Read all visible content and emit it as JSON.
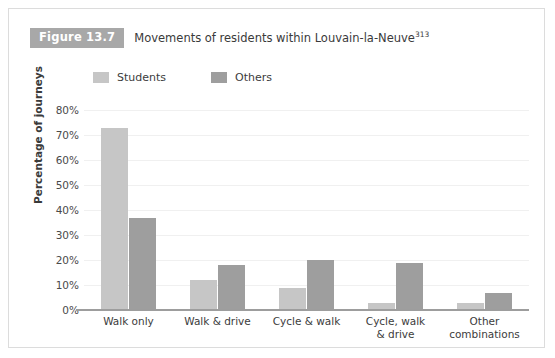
{
  "figure": {
    "tag": "Figure 13.7",
    "caption": "Movements of residents within Louvain-la-Neuve",
    "caption_superscript": "313"
  },
  "colors": {
    "students": "#c6c6c6",
    "others": "#9e9e9e",
    "tag_background": "#a8a8a8",
    "axis": "#9d9d9d",
    "gridline": "#f0f0f0",
    "card_border": "#dcdcdc",
    "text": "#3c3c3c"
  },
  "chart_data": {
    "type": "bar",
    "title": "Movements of residents within Louvain-la-Neuve",
    "xlabel": "",
    "ylabel": "Percentage of journeys",
    "ylim": [
      0,
      80
    ],
    "ytick_labels": [
      "0%",
      "10%",
      "20%",
      "30%",
      "40%",
      "50%",
      "60%",
      "70%",
      "80%"
    ],
    "ytick_values": [
      0,
      10,
      20,
      30,
      40,
      50,
      60,
      70,
      80
    ],
    "grid": true,
    "legend_position": "top-left",
    "categories": [
      "Walk only",
      "Walk & drive",
      "Cycle & walk",
      "Cycle, walk & drive",
      "Other combinations"
    ],
    "category_lines": [
      [
        "Walk only"
      ],
      [
        "Walk & drive"
      ],
      [
        "Cycle & walk"
      ],
      [
        "Cycle, walk",
        "& drive"
      ],
      [
        "Other",
        "combinations"
      ]
    ],
    "series": [
      {
        "name": "Students",
        "color": "#c6c6c6",
        "values": [
          73,
          12,
          9,
          3,
          3
        ]
      },
      {
        "name": "Others",
        "color": "#9e9e9e",
        "values": [
          37,
          18,
          20,
          19,
          7
        ]
      }
    ]
  }
}
